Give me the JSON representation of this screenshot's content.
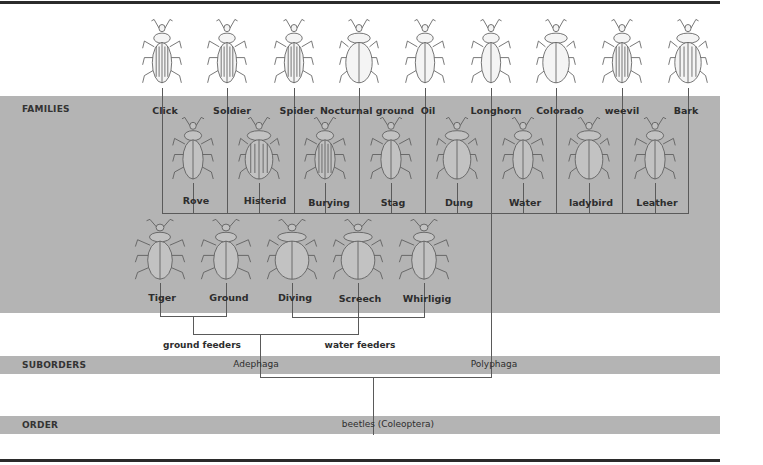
{
  "diagram": {
    "type": "taxonomy-tree",
    "colors": {
      "band": "#b4b4b4",
      "rule": "#2b2b2b",
      "line": "#5a5a5a",
      "text": "#2d2d2d"
    },
    "ranks": {
      "families": "FAMILIES",
      "suborders": "SUBORDERS",
      "order": "ORDER"
    },
    "families_row1": [
      {
        "name": "Click",
        "x": 162
      },
      {
        "name": "Soldier",
        "x": 227
      },
      {
        "name": "Spider",
        "x": 294
      },
      {
        "name": "Nocturnal ground",
        "x": 359
      },
      {
        "name": "Oil",
        "x": 425
      },
      {
        "name": "Longhorn",
        "x": 491
      },
      {
        "name": "Colorado",
        "x": 556
      },
      {
        "name": "weevil",
        "x": 622
      },
      {
        "name": "Bark",
        "x": 688
      }
    ],
    "families_row2": [
      {
        "name": "Rove",
        "x": 193
      },
      {
        "name": "Histerid",
        "x": 259
      },
      {
        "name": "Burying",
        "x": 325
      },
      {
        "name": "Stag",
        "x": 391
      },
      {
        "name": "Dung",
        "x": 457
      },
      {
        "name": "Water",
        "x": 523
      },
      {
        "name": "ladybird",
        "x": 589
      },
      {
        "name": "Leather",
        "x": 655
      }
    ],
    "families_row3": [
      {
        "name": "Tiger",
        "x": 160
      },
      {
        "name": "Ground",
        "x": 226
      },
      {
        "name": "Diving",
        "x": 292
      },
      {
        "name": "Screech",
        "x": 358
      },
      {
        "name": "Whirligig",
        "x": 424
      }
    ],
    "groups": {
      "ground_feeders": "ground feeders",
      "water_feeders": "water feeders"
    },
    "suborders": {
      "adephaga": "Adephaga",
      "polyphaga": "Polyphaga"
    },
    "order": {
      "name": "beetles (Coleoptera)"
    }
  }
}
